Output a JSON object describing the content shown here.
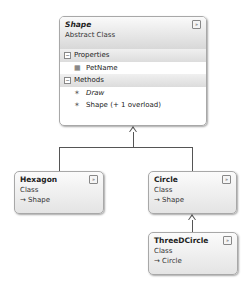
{
  "diagram": {
    "type": "class-diagram",
    "classes": [
      {
        "name": "Shape",
        "kind": "Abstract Class",
        "sections": [
          {
            "label": "Properties",
            "members": [
              {
                "name": "PetName",
                "icon": "property-icon",
                "italic": false
              }
            ]
          },
          {
            "label": "Methods",
            "members": [
              {
                "name": "Draw",
                "icon": "method-icon",
                "italic": true
              },
              {
                "name": "Shape (+ 1 overload)",
                "icon": "method-icon",
                "italic": false
              }
            ]
          }
        ],
        "toggle": "collapse"
      },
      {
        "name": "Hexagon",
        "kind": "Class",
        "inherits": "→ Shape",
        "toggle": "expand"
      },
      {
        "name": "Circle",
        "kind": "Class",
        "inherits": "→ Shape",
        "toggle": "expand"
      },
      {
        "name": "ThreeDCircle",
        "kind": "Class",
        "inherits": "→ Circle",
        "toggle": "expand"
      }
    ],
    "relationships": [
      {
        "from": "Hexagon",
        "to": "Shape",
        "type": "inheritance"
      },
      {
        "from": "Circle",
        "to": "Shape",
        "type": "inheritance"
      },
      {
        "from": "ThreeDCircle",
        "to": "Circle",
        "type": "inheritance"
      }
    ],
    "icons": {
      "collapse": "»",
      "expand": "»",
      "section_toggle": "−",
      "property": "▦",
      "method": "✶"
    }
  }
}
